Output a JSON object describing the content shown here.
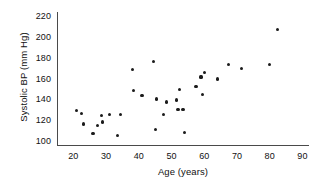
{
  "chart_data": {
    "type": "scatter",
    "title": "",
    "xlabel": "Age (years)",
    "ylabel": "Systolic BP (mm Hg)",
    "xlim": [
      15,
      92
    ],
    "ylim": [
      97,
      224
    ],
    "xticks": [
      20,
      30,
      40,
      50,
      60,
      70,
      80,
      90
    ],
    "yticks": [
      100,
      120,
      140,
      160,
      180,
      200,
      220
    ],
    "grid": false,
    "legend": null,
    "marker": {
      "shape": "circle",
      "color": "#1b1b1b",
      "size_px": 3.2
    },
    "axis_color": "#4a4a4a",
    "points": [
      {
        "x": 21.0,
        "y": 130
      },
      {
        "x": 22.5,
        "y": 127
      },
      {
        "x": 23.0,
        "y": 117
      },
      {
        "x": 26.0,
        "y": 108
      },
      {
        "x": 27.5,
        "y": 116
      },
      {
        "x": 28.5,
        "y": 125
      },
      {
        "x": 29.0,
        "y": 119
      },
      {
        "x": 31.0,
        "y": 126
      },
      {
        "x": 33.5,
        "y": 106
      },
      {
        "x": 34.5,
        "y": 126
      },
      {
        "x": 38.0,
        "y": 169
      },
      {
        "x": 38.5,
        "y": 149
      },
      {
        "x": 41.0,
        "y": 144
      },
      {
        "x": 44.5,
        "y": 177
      },
      {
        "x": 45.0,
        "y": 112
      },
      {
        "x": 45.5,
        "y": 141
      },
      {
        "x": 47.5,
        "y": 126
      },
      {
        "x": 48.5,
        "y": 138
      },
      {
        "x": 51.5,
        "y": 140
      },
      {
        "x": 52.0,
        "y": 131
      },
      {
        "x": 52.5,
        "y": 150
      },
      {
        "x": 53.5,
        "y": 131
      },
      {
        "x": 54.0,
        "y": 109
      },
      {
        "x": 57.5,
        "y": 153
      },
      {
        "x": 59.0,
        "y": 162
      },
      {
        "x": 59.5,
        "y": 145
      },
      {
        "x": 60.0,
        "y": 166
      },
      {
        "x": 64.0,
        "y": 160
      },
      {
        "x": 67.5,
        "y": 174
      },
      {
        "x": 71.5,
        "y": 170
      },
      {
        "x": 80.0,
        "y": 174
      },
      {
        "x": 82.5,
        "y": 207
      }
    ]
  },
  "axes": {
    "x_title": "Age (years)",
    "y_title": "Systolic BP (mm Hg)",
    "x_tick_labels": [
      "20",
      "30",
      "40",
      "50",
      "60",
      "70",
      "80",
      "90"
    ],
    "y_tick_labels": [
      "220",
      "200",
      "180",
      "160",
      "140",
      "120",
      "100"
    ]
  }
}
